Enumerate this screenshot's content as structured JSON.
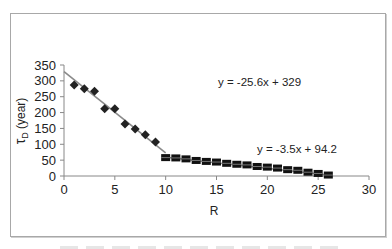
{
  "chart_data": {
    "type": "scatter",
    "title": "",
    "xlabel": "R",
    "ylabel": "τD (year)",
    "ylabel_main": "τ",
    "ylabel_sub": "D",
    "ylabel_rest": " (year)",
    "xlim": [
      0,
      30
    ],
    "ylim": [
      0,
      350
    ],
    "x_ticks": [
      0,
      5,
      10,
      15,
      20,
      25,
      30
    ],
    "y_ticks": [
      0,
      50,
      100,
      150,
      200,
      250,
      300,
      350
    ],
    "grid": false,
    "legend": "none",
    "series": [
      {
        "name": "R 1-10",
        "marker": "diamond",
        "color": "#222222",
        "x": [
          1,
          2,
          3,
          4,
          5,
          6,
          7,
          8,
          9
        ],
        "y": [
          287,
          275,
          267,
          212,
          212,
          164,
          148,
          130,
          107
        ],
        "trendline": {
          "slope": -25.6,
          "intercept": 329,
          "x_range": [
            0,
            10
          ],
          "label": "y = -25.6x + 329"
        }
      },
      {
        "name": "R 10-26",
        "marker": "square",
        "color": "#111111",
        "x": [
          10,
          11,
          12,
          13,
          14,
          15,
          16,
          17,
          18,
          19,
          20,
          21,
          22,
          23,
          24,
          25,
          26
        ],
        "y": [
          58,
          57,
          54,
          49,
          46,
          44,
          40,
          37,
          35,
          30,
          28,
          25,
          20,
          18,
          12,
          8,
          3
        ],
        "trendline": {
          "slope": -3.5,
          "intercept": 94.2,
          "x_range": [
            10,
            26
          ],
          "label": "y = -3.5x + 94.2"
        }
      }
    ]
  },
  "labels": {
    "eq1": "y = -25.6x + 329",
    "eq2": "y = -3.5x + 94.2",
    "xlabel": "R",
    "ylabel_main": "τ",
    "ylabel_sub": "D",
    "ylabel_rest": " (year)"
  }
}
